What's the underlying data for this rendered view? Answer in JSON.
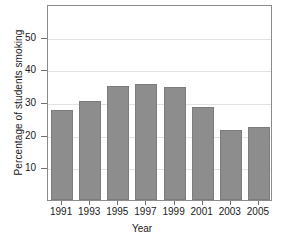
{
  "chart_data": {
    "type": "bar",
    "title": "",
    "xlabel": "Year",
    "ylabel": "Percentage of students smoking",
    "categories": [
      "1991",
      "1993",
      "1995",
      "1997",
      "1999",
      "2001",
      "2003",
      "2005"
    ],
    "values": [
      27.5,
      30.2,
      34.8,
      35.5,
      34.7,
      28.5,
      21.4,
      22.5
    ],
    "ylim": [
      0,
      60
    ],
    "yticks": [
      10,
      20,
      30,
      40,
      50
    ],
    "ytick_labels": [
      "10",
      "20",
      "30",
      "40",
      "50"
    ],
    "xtick_labels": [
      "1991",
      "1993",
      "1995",
      "1997",
      "1999",
      "2001",
      "2003",
      "2005"
    ],
    "grid": true,
    "grid_axis": "y",
    "legend": false,
    "legend_position": "none",
    "bar_color": "#8d8d8d",
    "bar_edge_color": "#7c7c7c",
    "gridline_color": "#e2e2e2",
    "frame_color": "#8c8c8c",
    "background": "#ffffff",
    "text_color": "#1a1a1a"
  }
}
